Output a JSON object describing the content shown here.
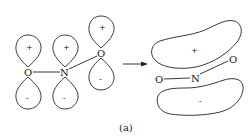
{
  "diagram": {
    "left": {
      "atoms": [
        {
          "id": "O1",
          "label": "O",
          "x": 28,
          "y": 72
        },
        {
          "id": "N",
          "label": "N",
          "x": 65,
          "y": 72
        },
        {
          "id": "O2",
          "label": "O",
          "x": 101,
          "y": 53
        }
      ],
      "orbitals": [
        {
          "atom": "O1",
          "upper_sign": "+",
          "lower_sign": "-"
        },
        {
          "atom": "N",
          "upper_sign": "+",
          "lower_sign": "-"
        },
        {
          "atom": "O2",
          "upper_sign": "+",
          "lower_sign": "-"
        }
      ]
    },
    "arrow": {
      "from_x": 123,
      "to_x": 148,
      "y": 64
    },
    "right": {
      "atoms": [
        {
          "id": "O1",
          "label": "O",
          "x": 159,
          "y": 79
        },
        {
          "id": "N",
          "label": "N",
          "x": 196,
          "y": 77
        },
        {
          "id": "O2",
          "label": "O",
          "x": 233,
          "y": 59
        }
      ],
      "upper_lobe_sign": "+",
      "lower_lobe_sign": "-"
    },
    "caption": "(a)",
    "stroke_color": "#222222"
  }
}
